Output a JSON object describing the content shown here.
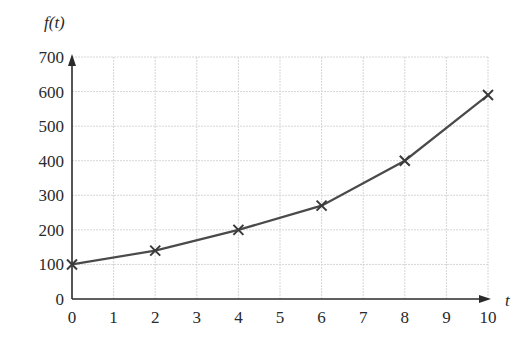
{
  "chart_data": {
    "type": "line",
    "title": "",
    "xlabel": "t",
    "ylabel": "f(t)",
    "x": [
      0,
      2,
      4,
      6,
      8,
      10
    ],
    "series": [
      {
        "name": "f(t)",
        "values": [
          100,
          140,
          200,
          270,
          400,
          590
        ],
        "marker": "x"
      }
    ],
    "xlim": [
      0,
      10
    ],
    "ylim": [
      0,
      700
    ],
    "xticks": [
      0,
      1,
      2,
      3,
      4,
      5,
      6,
      7,
      8,
      9,
      10
    ],
    "yticks": [
      0,
      100,
      200,
      300,
      400,
      500,
      600,
      700
    ],
    "grid": true,
    "legend": null
  },
  "labels": {
    "x_axis": "t",
    "y_axis": "f(t)"
  }
}
